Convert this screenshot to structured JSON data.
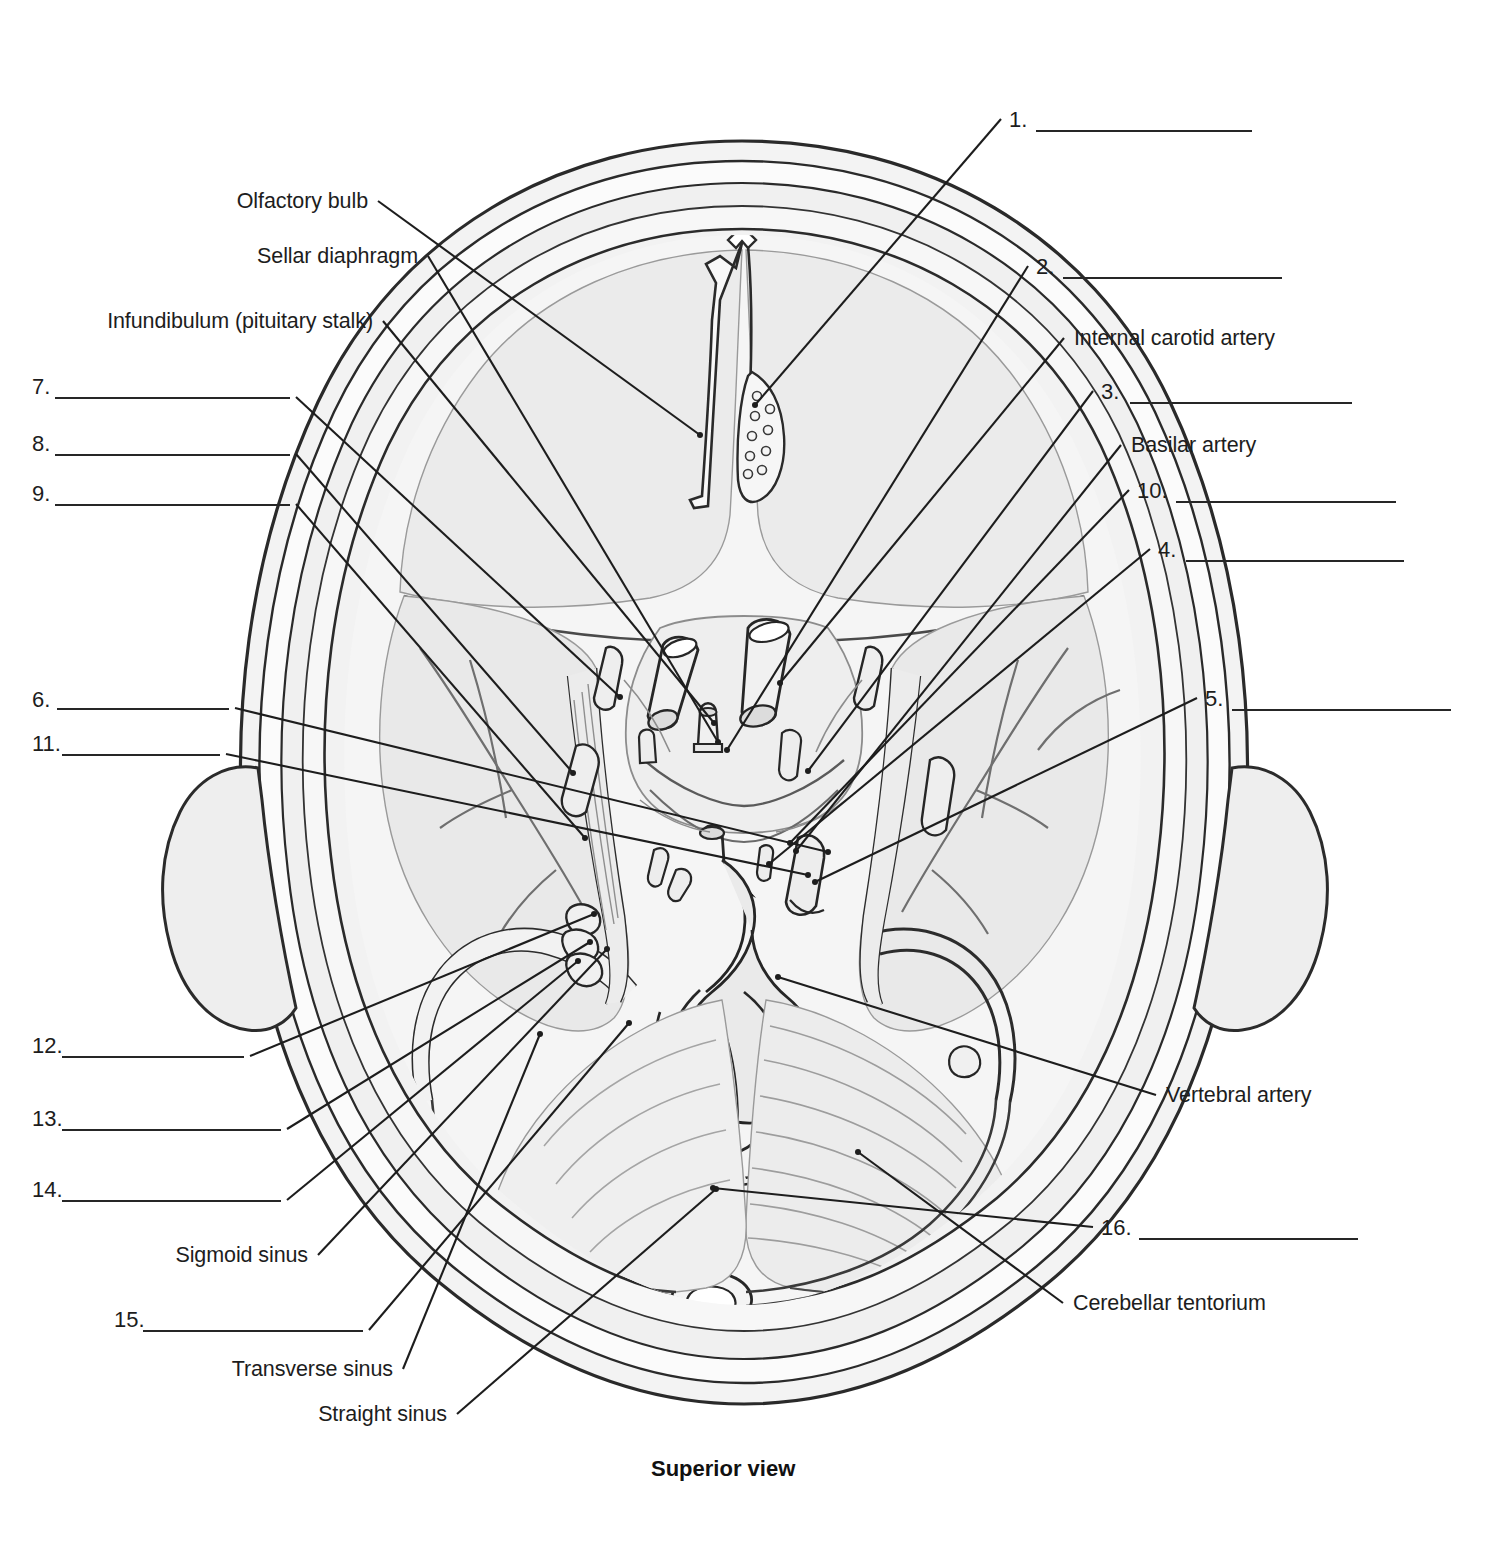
{
  "figure": {
    "caption": "Superior view"
  },
  "named_labels": [
    {
      "id": "olfactory-bulb",
      "text": "Olfactory bulb",
      "x": 368,
      "y": 190,
      "anchor": "end",
      "tip_x": 700,
      "tip_y": 435
    },
    {
      "id": "sellar-diaphragm",
      "text": "Sellar diaphragm",
      "x": 418,
      "y": 245,
      "anchor": "end",
      "tip_x": 718,
      "tip_y": 742
    },
    {
      "id": "infundibulum",
      "text": "Infundibulum (pituitary stalk)",
      "x": 373,
      "y": 310,
      "anchor": "end",
      "tip_x": 714,
      "tip_y": 723
    },
    {
      "id": "internal-carotid-artery",
      "text": "Internal carotid artery",
      "x": 1074,
      "y": 327,
      "anchor": "start",
      "tip_x": 780,
      "tip_y": 683
    },
    {
      "id": "basilar-artery",
      "text": "Basilar artery",
      "x": 1131,
      "y": 434,
      "anchor": "start",
      "tip_x": 796,
      "tip_y": 851
    },
    {
      "id": "vertebral-artery",
      "text": "Vertebral artery",
      "x": 1166,
      "y": 1084,
      "anchor": "start",
      "tip_x": 778,
      "tip_y": 977
    },
    {
      "id": "cerebellar-tentorium",
      "text": "Cerebellar tentorium",
      "x": 1073,
      "y": 1292,
      "anchor": "start",
      "tip_x": 858,
      "tip_y": 1152
    },
    {
      "id": "sigmoid-sinus",
      "text": "Sigmoid sinus",
      "x": 308,
      "y": 1244,
      "anchor": "end",
      "tip_x": 607,
      "tip_y": 949
    },
    {
      "id": "transverse-sinus",
      "text": "Transverse sinus",
      "x": 393,
      "y": 1358,
      "anchor": "end",
      "tip_x": 540,
      "tip_y": 1034
    },
    {
      "id": "straight-sinus",
      "text": "Straight sinus",
      "x": 447,
      "y": 1403,
      "anchor": "end",
      "tip_x": 716,
      "tip_y": 1189
    }
  ],
  "numbered_blanks": [
    {
      "number": "1.",
      "side": "right",
      "num_x": 1009,
      "num_y": 107,
      "line_x": 1036,
      "line_y": 130,
      "line_w": 216,
      "tip_x": 755,
      "tip_y": 405
    },
    {
      "number": "2.",
      "side": "right",
      "num_x": 1036,
      "num_y": 254,
      "line_x": 1063,
      "line_y": 277,
      "line_w": 219,
      "tip_x": 727,
      "tip_y": 750
    },
    {
      "number": "3.",
      "side": "right",
      "num_x": 1101,
      "num_y": 379,
      "line_x": 1130,
      "line_y": 402,
      "line_w": 222,
      "tip_x": 808,
      "tip_y": 771
    },
    {
      "number": "4.",
      "side": "right",
      "num_x": 1158,
      "num_y": 537,
      "line_x": 1186,
      "line_y": 560,
      "line_w": 218,
      "tip_x": 769,
      "tip_y": 864
    },
    {
      "number": "5.",
      "side": "right",
      "num_x": 1205,
      "num_y": 686,
      "line_x": 1232,
      "line_y": 709,
      "line_w": 219,
      "tip_x": 815,
      "tip_y": 882
    },
    {
      "number": "10.",
      "side": "right",
      "num_x": 1137,
      "num_y": 478,
      "line_x": 1176,
      "line_y": 501,
      "line_w": 220,
      "tip_x": 790,
      "tip_y": 843
    },
    {
      "number": "16.",
      "side": "right",
      "num_x": 1101,
      "num_y": 1215,
      "line_x": 1139,
      "line_y": 1238,
      "line_w": 219,
      "tip_x": 713,
      "tip_y": 1188
    },
    {
      "number": "7.",
      "side": "left",
      "num_x": 32,
      "num_y": 374,
      "line_x": 55,
      "line_y": 397,
      "line_w": 235,
      "tip_x": 620,
      "tip_y": 697
    },
    {
      "number": "8.",
      "side": "left",
      "num_x": 32,
      "num_y": 431,
      "line_x": 55,
      "line_y": 454,
      "line_w": 235,
      "tip_x": 573,
      "tip_y": 773
    },
    {
      "number": "9.",
      "side": "left",
      "num_x": 32,
      "num_y": 481,
      "line_x": 55,
      "line_y": 504,
      "line_w": 235,
      "tip_x": 585,
      "tip_y": 838
    },
    {
      "number": "6.",
      "side": "left",
      "num_x": 32,
      "num_y": 687,
      "line_x": 57,
      "line_y": 708,
      "line_w": 172,
      "tip_x": 828,
      "tip_y": 852
    },
    {
      "number": "11.",
      "side": "left",
      "num_x": 32,
      "num_y": 731,
      "line_x": 62,
      "line_y": 754,
      "line_w": 158,
      "tip_x": 808,
      "tip_y": 875
    },
    {
      "number": "12.",
      "side": "left",
      "num_x": 32,
      "num_y": 1033,
      "line_x": 62,
      "line_y": 1056,
      "line_w": 182,
      "tip_x": 594,
      "tip_y": 914
    },
    {
      "number": "13.",
      "side": "left",
      "num_x": 32,
      "num_y": 1106,
      "line_x": 62,
      "line_y": 1129,
      "line_w": 219,
      "tip_x": 590,
      "tip_y": 942
    },
    {
      "number": "14.",
      "side": "left",
      "num_x": 32,
      "num_y": 1177,
      "line_x": 62,
      "line_y": 1200,
      "line_w": 219,
      "tip_x": 578,
      "tip_y": 961
    },
    {
      "number": "15.",
      "side": "left",
      "num_x": 114,
      "num_y": 1307,
      "line_x": 143,
      "line_y": 1330,
      "line_w": 220,
      "tip_x": 629,
      "tip_y": 1023
    }
  ],
  "colors": {
    "ink": "#1d1d1d",
    "line": "#262626",
    "fill_light": "#f1f1f1",
    "fill_mid": "#e3e3e3",
    "fill_dark": "#d6d6d6",
    "stroke_soft": "#8a8a8a"
  }
}
